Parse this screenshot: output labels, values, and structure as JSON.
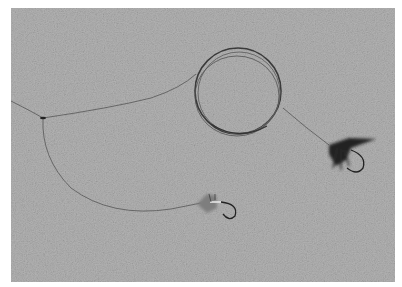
{
  "image": {
    "kind": "grayscale photograph",
    "subject": "fishing leader coil with two wet flies on a textured surface",
    "colors": {
      "background_border": "#ffffff",
      "surface": "#a9a9a9",
      "line": "#4a4a4a",
      "fly_dark": "#1e1e1e"
    },
    "objects": [
      {
        "name": "leader-coil",
        "description": "coiled monofilament leader"
      },
      {
        "name": "dropper-knot",
        "description": "knot where dropper line branches"
      },
      {
        "name": "dark-fly",
        "description": "dark hackled wet fly on right"
      },
      {
        "name": "light-fly",
        "description": "sparse light-bodied fly at bottom center"
      }
    ]
  }
}
